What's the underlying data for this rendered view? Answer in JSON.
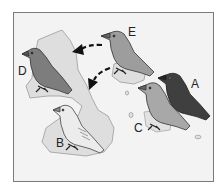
{
  "figure": {
    "top_caption_fragment": "",
    "background": "#f3f3f3",
    "island_color": "#dedede",
    "island_stroke": "#9a9a9a",
    "arrow_color": "#111111",
    "birds": [
      {
        "label": "A",
        "shade": "#3f3f3f",
        "description": "darkest bird, right"
      },
      {
        "label": "B",
        "shade": "#e6e6e6",
        "description": "pale bird on southern island"
      },
      {
        "label": "C",
        "shade": "#a8a8a8",
        "description": "medium grey bird, front right"
      },
      {
        "label": "D",
        "shade": "#7d7d7d",
        "description": "grey bird on western island"
      },
      {
        "label": "E",
        "shade": "#9d9d9d",
        "description": "ancestral bird, top center"
      }
    ],
    "arrows": [
      {
        "from": "E",
        "to": "D",
        "style": "dashed"
      },
      {
        "from": "E",
        "to": "B",
        "style": "dashed"
      }
    ]
  }
}
